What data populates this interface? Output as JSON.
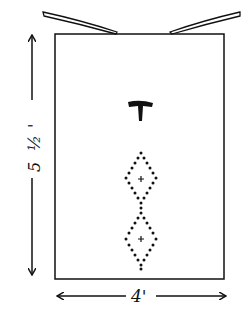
{
  "diagram": {
    "type": "dimensioned-sketch",
    "shape": "rectangle",
    "dimensions": {
      "height_label": "5 ½'",
      "height_parts": [
        "5",
        "½",
        "'"
      ],
      "width_label": "4'"
    },
    "features": {
      "top_flaps": 2,
      "center_symbol": "T",
      "diamond_motifs": 2,
      "diamond_center_mark": "+"
    },
    "colors": {
      "ink": "#111111",
      "background": "#ffffff"
    }
  }
}
